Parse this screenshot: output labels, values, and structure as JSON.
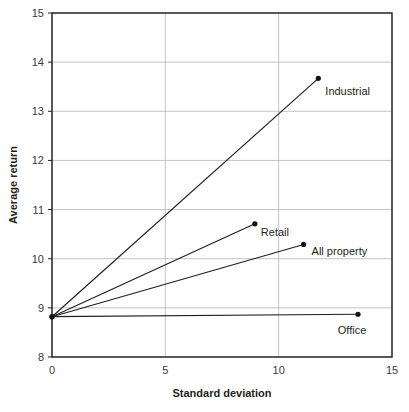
{
  "chart_data": {
    "type": "line",
    "title": "",
    "xlabel": "Standard deviation",
    "ylabel": "Average return",
    "xlim": [
      0,
      15
    ],
    "ylim": [
      8,
      15
    ],
    "x_ticks": [
      "0",
      "5",
      "10",
      "15"
    ],
    "y_ticks": [
      "8",
      "9",
      "10",
      "11",
      "12",
      "13",
      "14",
      "15"
    ],
    "grid": true,
    "legend": "none (direct labels)",
    "origin_point": {
      "x": 0,
      "y": 8.82
    },
    "series": [
      {
        "name": "Industrial",
        "x": [
          0,
          11.75
        ],
        "y": [
          8.82,
          13.67
        ]
      },
      {
        "name": "Retail",
        "x": [
          0,
          8.95
        ],
        "y": [
          8.82,
          10.71
        ]
      },
      {
        "name": "All property",
        "x": [
          0,
          11.1
        ],
        "y": [
          8.82,
          10.29
        ]
      },
      {
        "name": "Office",
        "x": [
          0,
          13.5
        ],
        "y": [
          8.82,
          8.87
        ]
      }
    ]
  }
}
